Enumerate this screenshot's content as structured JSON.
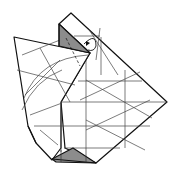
{
  "diagram": {
    "type": "origami-fold-diagram",
    "colors": {
      "paper": "#ffffff",
      "outline": "#111111",
      "crease": "#333333",
      "shade": "#8c8c8c",
      "background": "#ffffff"
    },
    "elements": [
      "folded-paper-model",
      "shaded-top-flap",
      "shaded-bottom-flap",
      "crease-lines",
      "fold-arrow"
    ]
  }
}
